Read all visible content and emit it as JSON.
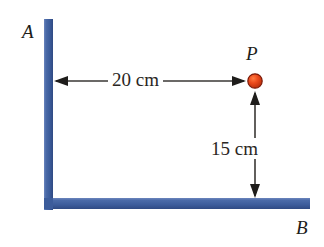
{
  "figure": {
    "colors": {
      "rod": "#41619f",
      "rod_shadow": "#2f4a83",
      "point": "#e8401c",
      "point_outline": "#7d1a08",
      "arrow": "#3a3734",
      "text": "#201c1a",
      "background": "#ffffff"
    },
    "labels": {
      "vertex_a": "A",
      "vertex_b": "B",
      "point_p": "P"
    },
    "dimensions": {
      "horizontal": "20 cm",
      "vertical": "15 cm"
    },
    "geometry": {
      "vertical_rod": {
        "x": 44,
        "y": 19,
        "width": 9,
        "height": 191
      },
      "horizontal_rod": {
        "x": 44,
        "y": 198,
        "width": 266,
        "height": 11
      },
      "point": {
        "cx": 255,
        "cy": 81,
        "r": 7
      },
      "horizontal_arrow": {
        "x1": 55,
        "x2": 245,
        "y": 81
      },
      "vertical_arrow": {
        "x": 255,
        "y1": 92,
        "y2": 197
      }
    }
  }
}
